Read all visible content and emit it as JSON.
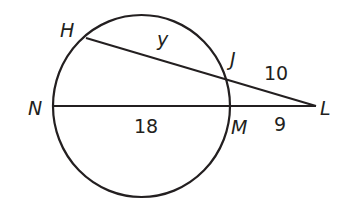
{
  "diagram": {
    "points": {
      "H": "H",
      "J": "J",
      "N": "N",
      "M": "M",
      "L": "L"
    },
    "segments": {
      "HJ": "y",
      "JL": "10",
      "NM": "18",
      "ML": "9"
    },
    "colors": {
      "stroke": "#231f20",
      "background": "#ffffff"
    }
  }
}
